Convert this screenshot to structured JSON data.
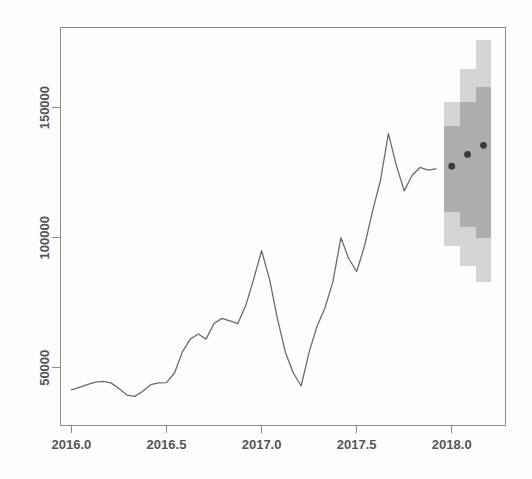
{
  "chart_data": {
    "type": "line",
    "title": "",
    "subtitle": "",
    "xlabel": "",
    "ylabel": "",
    "xlim": [
      2015.94,
      2018.28
    ],
    "ylim": [
      28000,
      181000
    ],
    "grid": false,
    "legend": null,
    "xticks": [
      2016.0,
      2016.5,
      2017.0,
      2017.5,
      2018.0
    ],
    "xtick_labels": [
      "2016.0",
      "2016.5",
      "2017.0",
      "2017.5",
      "2018.0"
    ],
    "yticks": [
      50000,
      100000,
      150000
    ],
    "ytick_labels": [
      "50000",
      "100000",
      "150000"
    ],
    "series": [
      {
        "name": "observed",
        "kind": "line",
        "color": "#6b6b6b",
        "x": [
          2016.0,
          2016.042,
          2016.083,
          2016.125,
          2016.167,
          2016.208,
          2016.25,
          2016.292,
          2016.333,
          2016.375,
          2016.417,
          2016.458,
          2016.5,
          2016.542,
          2016.583,
          2016.625,
          2016.667,
          2016.708,
          2016.75,
          2016.792,
          2016.833,
          2016.875,
          2016.917,
          2016.958,
          2017.0,
          2017.042,
          2017.083,
          2017.125,
          2017.167,
          2017.208,
          2017.25,
          2017.292,
          2017.333,
          2017.375,
          2017.417,
          2017.458,
          2017.5,
          2017.542,
          2017.583,
          2017.625,
          2017.667,
          2017.708,
          2017.75,
          2017.792,
          2017.833,
          2017.875,
          2017.917
        ],
        "y": [
          41500,
          42500,
          43500,
          44500,
          44800,
          44200,
          42000,
          39500,
          39000,
          41000,
          43500,
          44200,
          44300,
          48000,
          56000,
          61000,
          63000,
          61000,
          67000,
          69000,
          68000,
          67000,
          74000,
          84000,
          95000,
          84000,
          69000,
          56000,
          48000,
          43000,
          56000,
          66000,
          73000,
          83000,
          100000,
          92000,
          87000,
          97000,
          110000,
          122000,
          140000,
          128000,
          118000,
          124000,
          127000,
          126000,
          126500
        ]
      },
      {
        "name": "forecast-mean",
        "kind": "points",
        "color": "#3a3a3a",
        "x": [
          2018.0,
          2018.083,
          2018.167
        ],
        "y": [
          127500,
          132000,
          135500
        ]
      }
    ],
    "intervals": [
      {
        "name": "95%-band",
        "color": "#d4d4d4",
        "x_steps": [
          {
            "x0": 2017.958,
            "x1": 2018.042,
            "lo": 97000,
            "hi": 152000
          },
          {
            "x0": 2018.042,
            "x1": 2018.125,
            "lo": 89000,
            "hi": 165000
          },
          {
            "x0": 2018.125,
            "x1": 2018.208,
            "lo": 83000,
            "hi": 176000
          }
        ]
      },
      {
        "name": "80%-band",
        "color": "#aeaeae",
        "x_steps": [
          {
            "x0": 2017.958,
            "x1": 2018.042,
            "lo": 110000,
            "hi": 143000
          },
          {
            "x0": 2018.042,
            "x1": 2018.125,
            "lo": 104000,
            "hi": 152000
          },
          {
            "x0": 2018.125,
            "x1": 2018.208,
            "lo": 100000,
            "hi": 158000
          }
        ]
      }
    ],
    "axis_color": "#8a8a8a",
    "plot_box": {
      "left": 60,
      "top": 27,
      "right": 505,
      "bottom": 425
    }
  }
}
